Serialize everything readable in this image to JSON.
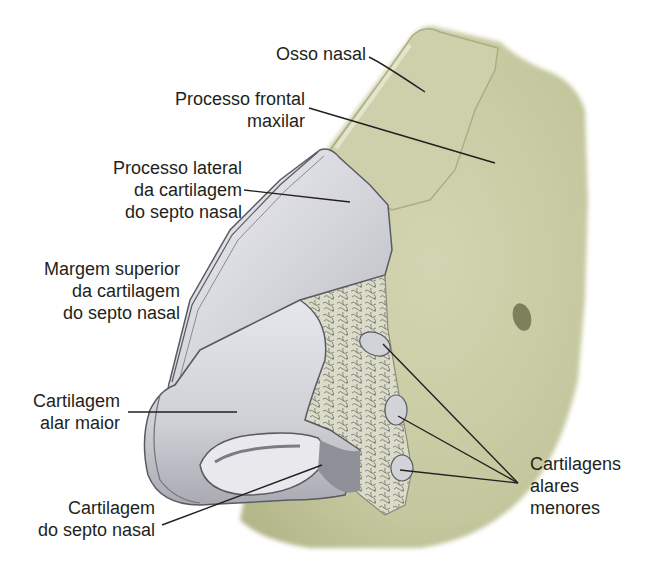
{
  "figure": {
    "type": "anatomical-illustration",
    "colors": {
      "bone": "#c9cba4",
      "bone_shadow": "#a9ad83",
      "cartilage": "#d9dadf",
      "cartilage_shadow": "#9d9ea6",
      "cartilage_outline": "#5a5b62",
      "fibrofatty_tissue": "#d8dac6",
      "leader_line": "#231f20",
      "text": "#231f20"
    }
  },
  "labels": {
    "osso_nasal": {
      "lines": [
        "Osso nasal"
      ]
    },
    "processo_frontal": {
      "lines": [
        "Processo frontal",
        "maxilar"
      ]
    },
    "processo_lateral": {
      "lines": [
        "Processo lateral",
        "da cartilagem",
        "do septo nasal"
      ]
    },
    "margem_superior": {
      "lines": [
        "Margem superior",
        "da cartilagem",
        "do septo nasal"
      ]
    },
    "cartilagem_alar_maior": {
      "lines": [
        "Cartilagem",
        "alar maior"
      ]
    },
    "cartilagem_septo": {
      "lines": [
        "Cartilagem",
        "do septo nasal"
      ]
    },
    "cartilagens_alares_menores": {
      "lines": [
        "Cartilagens",
        "alares",
        "menores"
      ]
    }
  }
}
